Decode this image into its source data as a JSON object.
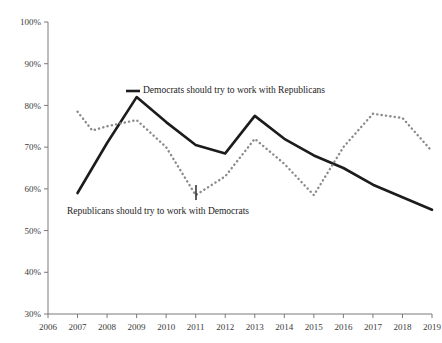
{
  "chart_data": {
    "type": "line",
    "title": "",
    "xlabel": "",
    "ylabel": "",
    "xlim": [
      2006,
      2019
    ],
    "ylim": [
      30,
      100
    ],
    "grid": false,
    "legend_position": "inline-annotations",
    "y_tick_labels": [
      "100%",
      "90%",
      "80%",
      "70%",
      "60%",
      "50%",
      "40%",
      "30%"
    ],
    "y_ticks": [
      100,
      90,
      80,
      70,
      60,
      50,
      40,
      30
    ],
    "x_tick_labels": [
      "2006",
      "2007",
      "2008",
      "2009",
      "2010",
      "2011",
      "2012",
      "2013",
      "2014",
      "2015",
      "2016",
      "2017",
      "2018",
      "2019"
    ],
    "x_ticks": [
      2006,
      2007,
      2008,
      2009,
      2010,
      2011,
      2012,
      2013,
      2014,
      2015,
      2016,
      2017,
      2018,
      2019
    ],
    "series": [
      {
        "name": "Democrats should try to work with Republicans",
        "style": "solid",
        "color": "#1c1c1c",
        "x": [
          2007,
          2008,
          2009,
          2010,
          2011,
          2012,
          2013,
          2014,
          2015,
          2016,
          2017,
          2018,
          2019
        ],
        "values": [
          59,
          71,
          82,
          76,
          70.5,
          68.5,
          77.5,
          72,
          68,
          65,
          61,
          58,
          55
        ]
      },
      {
        "name": "Republicans should try to work with Democrats",
        "style": "dotted",
        "color": "#8a8a8a",
        "x": [
          2007,
          2007.5,
          2008,
          2009,
          2010,
          2011,
          2012,
          2013,
          2014,
          2015,
          2016,
          2017,
          2018,
          2019
        ],
        "values": [
          78.5,
          74,
          75,
          76.5,
          70,
          58.5,
          63,
          72,
          66,
          58.5,
          70,
          78,
          77,
          69
        ]
      }
    ],
    "annotations": [
      {
        "text": "Democrats should try to work with Republicans",
        "series": "solid",
        "x_px": 143,
        "y_px": 93,
        "leader_x1": 126,
        "leader_y1": 91,
        "leader_x2": 140,
        "leader_y2": 91,
        "leader_type": "legend-dash"
      },
      {
        "text": "Republicans should try to work with Democrats",
        "series": "dotted",
        "x_px": 67,
        "y_px": 214,
        "leader_x1": 196,
        "leader_y1": 185,
        "leader_x2": 196,
        "leader_y2": 200,
        "leader_type": "vertical"
      }
    ]
  }
}
